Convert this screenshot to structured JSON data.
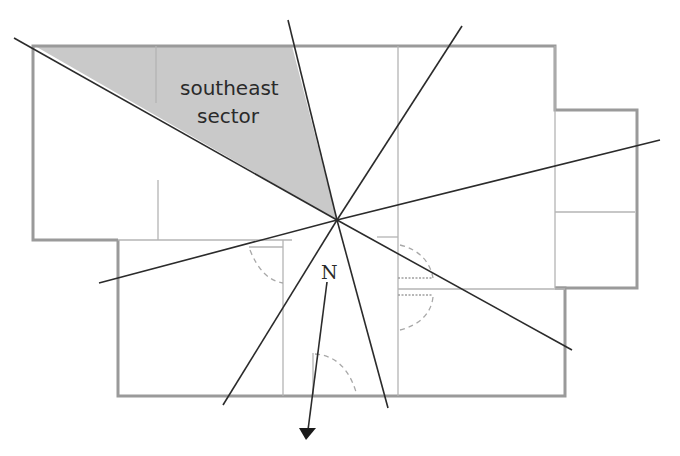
{
  "diagram": {
    "sector_label_line1": "southeast",
    "sector_label_line2": "sector",
    "north_label": "N",
    "colors": {
      "sector_fill": "#c9c9c9",
      "wall": "#9a9a9a",
      "rays": "#2b2b2b"
    }
  }
}
